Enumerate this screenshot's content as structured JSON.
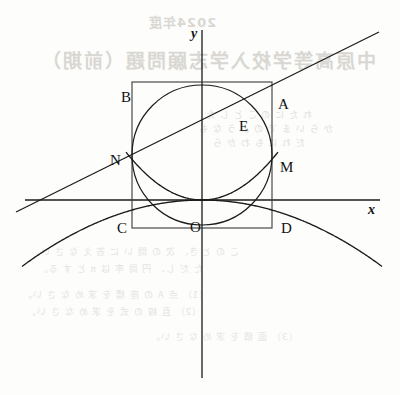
{
  "figure": {
    "width": 400,
    "height": 395,
    "background": "#fdfdfc",
    "stroke_color": "#1a1a1a",
    "bleed_color": "#d9d7d2"
  },
  "axes": {
    "x_label": "x",
    "y_label": "y",
    "origin_label": "O",
    "origin_px": [
      202,
      200
    ],
    "x_axis_px": [
      25,
      200,
      380,
      200
    ],
    "y_axis_px": [
      202,
      30,
      202,
      378
    ]
  },
  "points": [
    {
      "name": "B",
      "label": "B",
      "px": [
        121,
        89
      ],
      "anchor_px": [
        132,
        82
      ]
    },
    {
      "name": "A",
      "label": "A",
      "px": [
        278,
        96
      ],
      "anchor_px": [
        272,
        82
      ]
    },
    {
      "name": "E",
      "label": "E",
      "px": [
        239,
        118
      ],
      "anchor_px": [
        250,
        105
      ]
    },
    {
      "name": "N",
      "label": "N",
      "px": [
        110,
        152
      ],
      "anchor_px": [
        132,
        152
      ]
    },
    {
      "name": "M",
      "label": "M",
      "px": [
        280,
        159
      ],
      "anchor_px": [
        272,
        152
      ]
    },
    {
      "name": "C",
      "label": "C",
      "px": [
        117,
        220
      ],
      "anchor_px": [
        132,
        228
      ]
    },
    {
      "name": "D",
      "label": "D",
      "px": [
        281,
        220
      ],
      "anchor_px": [
        272,
        228
      ]
    },
    {
      "name": "O",
      "label": "O",
      "px": [
        190,
        219
      ],
      "anchor_px": [
        202,
        200
      ]
    }
  ],
  "shapes": {
    "square": {
      "name": "rectangle-ABDC",
      "left": 132,
      "top": 82,
      "right": 272,
      "bottom": 228
    },
    "circle": {
      "name": "inscribed-circle",
      "cx": 202,
      "cy": 155,
      "r": 70
    },
    "parabola_up": {
      "name": "upward-parabola",
      "vertex_px": [
        202,
        200
      ],
      "a": 0.0083,
      "x_from": 126,
      "x_to": 278
    },
    "parabola_down": {
      "name": "downward-parabola",
      "vertex_px": [
        202,
        200
      ],
      "a": -0.00205,
      "x_from": 22,
      "x_to": 382
    },
    "line": {
      "name": "diagonal-secant-line",
      "x1": 16,
      "y1": 212,
      "x2": 379,
      "y2": 32
    }
  },
  "bleed_through": {
    "year": "2024年度",
    "title": "中原高等学校入学志願問題（前期）",
    "body_1": "れ た に の こ と し た",
    "body_2": "か ら い ま で の よ う な も",
    "body_3": "だ れ に も わ か ら",
    "body_4": "こ の と き、 次 の 問 い に 答 え な さ い。",
    "body_5": "た だ し、 円 周 率 は π と す る。",
    "body_6": "（1） 点 A の 座 標 を 求 め な さ い。",
    "body_7": "（2） 直 線 の 式 を 求 め な さ い。",
    "body_8": "（3） 面 積 を 求 め な さ い。"
  }
}
